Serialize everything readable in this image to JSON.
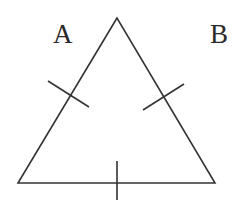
{
  "diagram": {
    "type": "equilateral-triangle-with-congruence-marks",
    "labels": {
      "left": "A",
      "right": "B"
    },
    "stroke_color": "#333333",
    "background": "#ffffff",
    "triangle": {
      "apex": [
        117,
        18
      ],
      "bottom_left": [
        18,
        183
      ],
      "bottom_right": [
        215,
        183
      ]
    },
    "tick_marks": [
      {
        "side": "left",
        "from": [
          48,
          81
        ],
        "to": [
          89,
          107
        ]
      },
      {
        "side": "right",
        "from": [
          143,
          110
        ],
        "to": [
          184,
          84
        ]
      },
      {
        "side": "bottom",
        "from": [
          117,
          161
        ],
        "to": [
          117,
          200
        ]
      }
    ]
  }
}
